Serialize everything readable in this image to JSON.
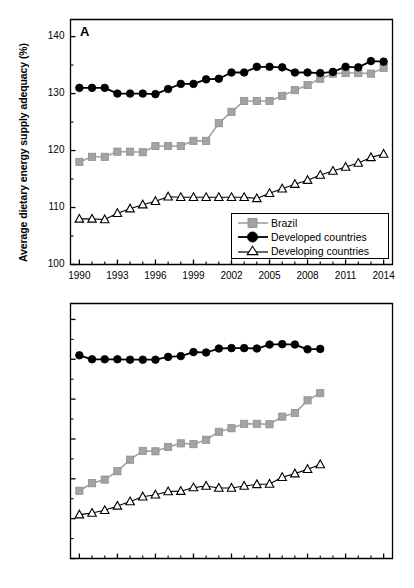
{
  "figure": {
    "background": "#ffffff",
    "colors": {
      "brazil": "#a3a3a3",
      "developed": "#000000",
      "developing_fill": "#ffffff",
      "developing_stroke": "#000000",
      "axis": "#000000"
    }
  },
  "panels": [
    {
      "letter": "A",
      "ylabel": "Average dietary energy supply adequacy (%)",
      "ylabel_plain": "Average dietary energy supply adequacy (%)",
      "yticks": [
        100,
        110,
        120,
        130,
        140
      ],
      "xticks": [
        1990,
        1993,
        1996,
        1999,
        2002,
        2005,
        2008,
        2011,
        2014
      ]
    },
    {
      "letter": "B",
      "ylabel": "Average protein supply (g per capita day",
      "ylabel_sup": "-1",
      "ylabel_tail": ")",
      "ylabel_plain": "Average protein supply (g per capita day-1)",
      "yticks": [
        50,
        60,
        70,
        80,
        90,
        100,
        110
      ],
      "xticks": [
        1990,
        1993,
        1996,
        1999,
        2002,
        2005,
        2008,
        2011,
        2014
      ]
    }
  ],
  "legend": {
    "position": "bottom-right-panel-a",
    "entries": [
      {
        "label": "Brazil",
        "marker": "square-filled-gray"
      },
      {
        "label": "Developed countries",
        "marker": "circle-filled-black"
      },
      {
        "label": "Developing countries",
        "marker": "triangle-open-black"
      }
    ]
  },
  "chart_data": [
    {
      "type": "line",
      "panel": "A",
      "title": "",
      "xlabel": "",
      "ylabel": "Average dietary energy supply adequacy (%)",
      "xlim": [
        1989.3,
        2014.7
      ],
      "ylim": [
        100,
        143
      ],
      "grid": false,
      "legend_position": "lower right",
      "x": [
        1990,
        1991,
        1992,
        1993,
        1994,
        1995,
        1996,
        1997,
        1998,
        1999,
        2000,
        2001,
        2002,
        2003,
        2004,
        2005,
        2006,
        2007,
        2008,
        2009,
        2010,
        2011,
        2012,
        2013,
        2014
      ],
      "series": [
        {
          "name": "Brazil",
          "marker": "square-filled-gray",
          "values": [
            118.0,
            118.9,
            118.9,
            119.8,
            119.8,
            119.7,
            120.8,
            120.8,
            120.8,
            121.7,
            121.7,
            124.8,
            126.8,
            128.7,
            128.7,
            128.7,
            129.6,
            130.6,
            131.5,
            132.6,
            133.5,
            133.6,
            133.6,
            133.5,
            134.5
          ]
        },
        {
          "name": "Developed countries",
          "marker": "circle-filled-black",
          "values": [
            131.0,
            131.0,
            131.0,
            130.0,
            130.0,
            130.0,
            129.9,
            130.8,
            131.7,
            131.7,
            132.5,
            132.6,
            133.7,
            133.7,
            134.7,
            134.7,
            134.6,
            133.7,
            133.7,
            133.6,
            133.8,
            134.7,
            134.6,
            135.7,
            135.6
          ]
        },
        {
          "name": "Developing countries",
          "marker": "triangle-open-black",
          "values": [
            108.0,
            108.0,
            107.9,
            109.0,
            109.8,
            110.5,
            111.1,
            111.9,
            111.8,
            111.8,
            111.8,
            111.8,
            111.8,
            111.8,
            111.6,
            112.5,
            113.3,
            114.1,
            114.8,
            115.7,
            116.4,
            117.1,
            117.8,
            118.8,
            119.4
          ]
        }
      ]
    },
    {
      "type": "line",
      "panel": "B",
      "title": "",
      "xlabel": "",
      "ylabel": "Average protein supply (g per capita day-1)",
      "xlim": [
        1989.3,
        2014.7
      ],
      "ylim": [
        50,
        114
      ],
      "grid": false,
      "legend_position": "none",
      "x": [
        1990,
        1991,
        1992,
        1993,
        1994,
        1995,
        1996,
        1997,
        1998,
        1999,
        2000,
        2001,
        2002,
        2003,
        2004,
        2005,
        2006,
        2007,
        2008,
        2009
      ],
      "series": [
        {
          "name": "Brazil",
          "marker": "square-filled-gray",
          "values": [
            67.0,
            68.9,
            69.8,
            71.9,
            74.8,
            77.0,
            76.9,
            78.0,
            78.9,
            78.7,
            79.8,
            81.8,
            82.7,
            83.8,
            83.8,
            83.7,
            85.6,
            86.5,
            89.7,
            91.5
          ]
        },
        {
          "name": "Developed countries",
          "marker": "circle-filled-black",
          "values": [
            101.0,
            100.0,
            100.0,
            100.0,
            99.9,
            99.9,
            99.9,
            100.6,
            100.8,
            101.8,
            101.7,
            102.7,
            102.8,
            102.8,
            102.7,
            103.7,
            103.8,
            103.7,
            102.5,
            102.6
          ]
        },
        {
          "name": "Developing countries",
          "marker": "triangle-open-black",
          "values": [
            61.0,
            61.4,
            62.1,
            63.2,
            64.3,
            65.5,
            66.0,
            66.8,
            66.9,
            67.8,
            68.2,
            67.7,
            67.7,
            68.2,
            68.6,
            68.7,
            70.4,
            71.3,
            72.4,
            73.6
          ]
        }
      ]
    }
  ]
}
